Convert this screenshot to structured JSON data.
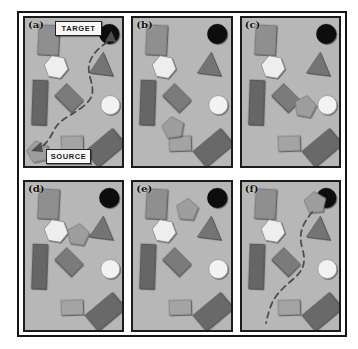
{
  "figure": {
    "background": "#ffffff",
    "frame_border_color": "#161616",
    "panel": {
      "background": "#b7b7b7",
      "border_color": "#1c1c1c"
    },
    "panels": [
      {
        "id": "a",
        "label": "(a)",
        "annotations": {
          "target": "TARGET",
          "source": "SOURCE"
        },
        "pentagon": {
          "x": 13,
          "y": 134,
          "rotate": -12
        },
        "path": {
          "name": "planned-route-dashed-path",
          "d": "M 82 24 C 68 34 60 44 65 60 C 69 74 69 80 56 90 C 42 100 34 102 29 112 C 25 120 22 124 18 128",
          "arrows": [
            "86,13 91,24 80,23",
            "6,133 16,124 18,134"
          ]
        }
      },
      {
        "id": "b",
        "label": "(b)",
        "pentagon": {
          "x": 40,
          "y": 110,
          "rotate": -8
        }
      },
      {
        "id": "c",
        "label": "(c)",
        "pentagon": {
          "x": 63,
          "y": 89,
          "rotate": 10
        }
      },
      {
        "id": "d",
        "label": "(d)",
        "pentagon": {
          "x": 53,
          "y": 53,
          "rotate": 8
        }
      },
      {
        "id": "e",
        "label": "(e)",
        "pentagon": {
          "x": 54,
          "y": 28,
          "rotate": 5
        }
      },
      {
        "id": "f",
        "label": "(f)",
        "pentagon": {
          "x": 73,
          "y": 21,
          "rotate": -5
        },
        "path": {
          "name": "traveled-route-dashed-path",
          "d": "M 70 30 C 60 42 56 52 60 66 C 64 80 62 88 50 98 C 38 108 31 116 28 126 C 26 132 25 136 24 141",
          "arrows": []
        }
      }
    ],
    "base_shapes": [
      {
        "name": "light-rect-upper-left",
        "type": "rect",
        "x": 13,
        "y": 7,
        "w": 21,
        "h": 30,
        "rotate": 3,
        "fill": "#8f8f8f"
      },
      {
        "name": "target-circle-black",
        "type": "circle",
        "cx": 84,
        "cy": 16,
        "r": 10,
        "fill": "#0d0d0d"
      },
      {
        "name": "hexagon-white",
        "type": "polygon",
        "points": "42.8,51.1 35.1,60.3 23.3,58.2 19.2,46.9 26.9,37.7 38.7,39.8",
        "fill": "#eeeeee",
        "stroke": "#8a8a8a"
      },
      {
        "name": "triangle-gray",
        "type": "polygon",
        "points": "78,34 88,58 64,55",
        "fill": "#747474"
      },
      {
        "name": "dark-rect-left",
        "type": "rect",
        "x": 7,
        "y": 62,
        "w": 15,
        "h": 45,
        "rotate": 2,
        "fill": "#666666"
      },
      {
        "name": "diamond-rotated-rect",
        "type": "rect",
        "x": -12,
        "y": -8.5,
        "w": 24,
        "h": 17,
        "tx": 44,
        "ty": 80,
        "rotate": 45,
        "fill": "#7b7b7b"
      },
      {
        "name": "white-circle",
        "type": "circle",
        "cx": 85,
        "cy": 87,
        "r": 9.5,
        "fill": "#f2f2f2",
        "stroke": "#999999"
      },
      {
        "name": "small-rect-bottom",
        "type": "rect",
        "x": 36,
        "y": 118,
        "w": 22,
        "h": 15,
        "rotate": -2,
        "fill": "#a4a4a4"
      },
      {
        "name": "rotated-rect-bottom-right",
        "type": "rect",
        "x": -18,
        "y": -10.5,
        "w": 36,
        "h": 21,
        "tx": 80,
        "ty": 130,
        "rotate": -40,
        "fill": "#696969"
      }
    ],
    "pentagon_style": {
      "name": "pentagon-moving-object",
      "points": "0,-11.5 10.9,-3.6 6.8,9.3 -6.8,9.3 -10.9,-3.6",
      "fill": "#9e9e9e",
      "stroke": "#787878"
    },
    "path_style": {
      "color": "#4f4f4f",
      "width": 1.8,
      "dash": "6 4.5"
    }
  }
}
